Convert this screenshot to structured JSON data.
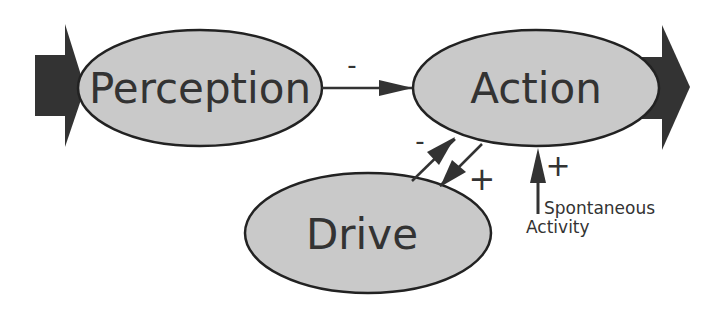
{
  "colors": {
    "ellipse_fill": "#c9c9c9",
    "stroke": "#222222",
    "big_arrow": "#333333",
    "text": "#333333",
    "background": "#ffffff"
  },
  "nodes": {
    "perception": {
      "label": "Perception"
    },
    "action": {
      "label": "Action"
    },
    "drive": {
      "label": "Drive"
    }
  },
  "edges": {
    "perception_to_action": {
      "sign": "-"
    },
    "drive_to_action": {
      "sign": "-"
    },
    "action_to_drive": {
      "sign": "+"
    },
    "spontaneous_to_action": {
      "sign": "+"
    }
  },
  "annotations": {
    "spontaneous_line1": "Spontaneous",
    "spontaneous_line2": "Activity"
  },
  "io": {
    "input_arrow": "input-arrow",
    "output_arrow": "output-arrow"
  }
}
